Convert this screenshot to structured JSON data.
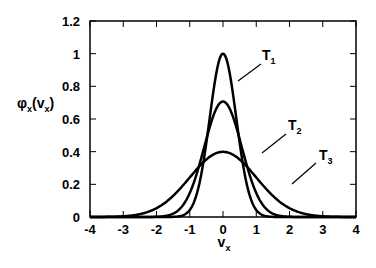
{
  "chart_data": {
    "type": "line",
    "title": "",
    "xlabel": "v",
    "xlabel_sub": "x",
    "ylabel": "φ",
    "ylabel_sub": "x",
    "ylabel_arg": "v",
    "ylabel_arg_sub": "x",
    "xlim": [
      -4,
      4
    ],
    "ylim": [
      0,
      1.2
    ],
    "xticks": [
      -4,
      -3,
      -2,
      -1,
      0,
      1,
      2,
      3,
      4
    ],
    "xtick_labels": [
      "-4",
      "-3",
      "-2",
      "-1",
      "0",
      "1",
      "2",
      "3",
      "4"
    ],
    "yticks": [
      0,
      0.2,
      0.4,
      0.6,
      0.8,
      1,
      1.2
    ],
    "ytick_labels": [
      "0",
      "0.2",
      "0.4",
      "0.6",
      "0.8",
      "1",
      "1.2"
    ],
    "grid": false,
    "legend": "inline labels with leader lines",
    "series": [
      {
        "name": "T1",
        "label": "T",
        "label_sub": "1",
        "shape": "gaussian",
        "mean": 0,
        "sigma": 0.399,
        "peak": 1.0,
        "label_pos": [
          262,
          60
        ],
        "leader": [
          [
            261,
            64
          ],
          [
            238,
            81
          ]
        ]
      },
      {
        "name": "T2",
        "label": "T",
        "label_sub": "2",
        "shape": "gaussian",
        "mean": 0,
        "sigma": 0.564,
        "peak": 0.707,
        "label_pos": [
          288,
          130
        ],
        "leader": [
          [
            286,
            134
          ],
          [
            262,
            153
          ]
        ]
      },
      {
        "name": "T3",
        "label": "T",
        "label_sub": "3",
        "shape": "gaussian",
        "mean": 0,
        "sigma": 1.0,
        "peak": 0.399,
        "label_pos": [
          319,
          160
        ],
        "leader": [
          [
            316,
            163
          ],
          [
            292,
            184
          ]
        ]
      }
    ],
    "sample_points": {
      "x": [
        -4,
        -3,
        -2,
        -1,
        -0.5,
        0,
        0.5,
        1,
        2,
        3,
        4
      ],
      "T1": [
        0.0,
        0.0,
        0.0,
        0.043,
        0.456,
        1.0,
        0.456,
        0.043,
        0.0,
        0.0,
        0.0
      ],
      "T2": [
        0.0,
        0.0,
        0.001,
        0.146,
        0.479,
        0.707,
        0.479,
        0.146,
        0.001,
        0.0,
        0.0
      ],
      "T3": [
        0.0001,
        0.004,
        0.054,
        0.242,
        0.352,
        0.399,
        0.352,
        0.242,
        0.054,
        0.004,
        0.0001
      ]
    }
  }
}
